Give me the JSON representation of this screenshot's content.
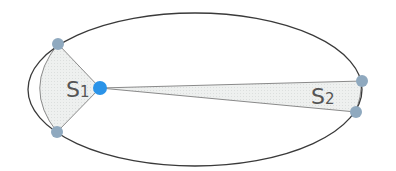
{
  "diagram": {
    "title": "",
    "labels": {
      "s1_main": "S",
      "s1_sub": "1",
      "s2_main": "S",
      "s2_sub": "2"
    },
    "colors": {
      "orbit": "#3a3a3a",
      "area_fill": "#ecefee",
      "area_stroke": "#8a8a8a",
      "planet": "#8fa9bf",
      "sun": "#2a93e8"
    }
  }
}
